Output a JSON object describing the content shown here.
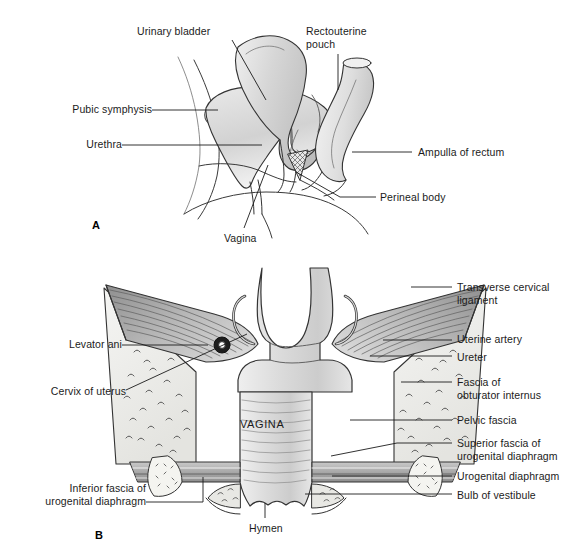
{
  "figure": {
    "background_color": "#ffffff",
    "ink_color": "#1b1b1b"
  },
  "panels": [
    {
      "letter": "A",
      "name": "sagittal-section",
      "letter_x": 92,
      "letter_y": 219,
      "labels": [
        {
          "id": "urinary-bladder",
          "text": "Urinary bladder",
          "align": "left",
          "x": 137,
          "y": 25,
          "leader": [
            [
              232,
              40
            ],
            [
              266,
              100
            ]
          ]
        },
        {
          "id": "rectouterine-pouch",
          "text": "Rectouterine\npouch",
          "align": "left",
          "x": 306,
          "y": 25,
          "leader": [
            [
              338,
              54
            ],
            [
              338,
              90
            ]
          ]
        },
        {
          "id": "pubic-symphysis",
          "text": "Pubic symphysis",
          "align": "right",
          "x": 45,
          "y": 103,
          "leader": [
            [
              152,
              110
            ],
            [
              218,
              110
            ]
          ]
        },
        {
          "id": "urethra",
          "text": "Urethra",
          "align": "right",
          "x": 83,
          "y": 138,
          "leader": [
            [
              122,
              145
            ],
            [
              262,
              145
            ]
          ]
        },
        {
          "id": "ampulla-of-rectum",
          "text": "Ampulla of rectum",
          "align": "left",
          "x": 420,
          "y": 146,
          "leader": [
            [
              352,
              152
            ],
            [
              412,
              152
            ]
          ]
        },
        {
          "id": "perineal-body",
          "text": "Perineal body",
          "align": "left",
          "x": 382,
          "y": 191,
          "leader": [
            [
              296,
              172
            ],
            [
              340,
              197
            ],
            [
              376,
              197
            ]
          ]
        },
        {
          "id": "vagina",
          "text": "Vagina",
          "align": "left",
          "x": 224,
          "y": 232,
          "leader": [
            [
              268,
              165
            ],
            [
              244,
              228
            ]
          ]
        }
      ]
    },
    {
      "letter": "B",
      "name": "coronal-section",
      "letter_x": 95,
      "letter_y": 529,
      "center_caption": "VAGINA",
      "center_caption_x": 240,
      "center_caption_y": 424,
      "labels": [
        {
          "id": "transverse-cervical-ligament",
          "text": "Transverse cervical\nligament",
          "align": "left",
          "x": 457,
          "y": 281,
          "leader": [
            [
              411,
              287
            ],
            [
              452,
              287
            ]
          ]
        },
        {
          "id": "uterine-artery",
          "text": "Uterine artery",
          "align": "left",
          "x": 457,
          "y": 333,
          "leader": [
            [
              383,
              340
            ],
            [
              452,
              340
            ]
          ]
        },
        {
          "id": "ureter",
          "text": "Ureter",
          "align": "left",
          "x": 457,
          "y": 351,
          "leader": [
            [
              370,
              356
            ],
            [
              452,
              356
            ]
          ]
        },
        {
          "id": "fascia-of-obturator-internus",
          "text": "Fascia of\nobturator internus",
          "align": "left",
          "x": 457,
          "y": 376,
          "leader": [
            [
              401,
              382
            ],
            [
              452,
              382
            ]
          ]
        },
        {
          "id": "pelvic-fascia",
          "text": "Pelvic fascia",
          "align": "left",
          "x": 457,
          "y": 414,
          "leader": [
            [
              350,
              420
            ],
            [
              452,
              420
            ]
          ]
        },
        {
          "id": "superior-fascia-ug-diaphragm",
          "text": "Superior fascia of\nurogenital diaphragm",
          "align": "left",
          "x": 457,
          "y": 437,
          "leader": [
            [
              331,
              456
            ],
            [
              397,
              443
            ],
            [
              452,
              443
            ]
          ]
        },
        {
          "id": "urogenital-diaphragm",
          "text": "Urogenital diaphragm",
          "align": "left",
          "x": 457,
          "y": 470,
          "leader": [
            [
              332,
              476
            ],
            [
              452,
              476
            ]
          ]
        },
        {
          "id": "bulb-of-vestibule",
          "text": "Bulb of vestibule",
          "align": "left",
          "x": 457,
          "y": 489,
          "leader": [
            [
              305,
              494
            ],
            [
              452,
              494
            ]
          ]
        },
        {
          "id": "levator-ani",
          "text": "Levator ani",
          "align": "right",
          "x": 48,
          "y": 338,
          "leader": [
            [
              122,
              345
            ],
            [
              208,
              345
            ]
          ]
        },
        {
          "id": "cervix-of-uterus",
          "text": "Cervix of uterus",
          "align": "right",
          "x": 28,
          "y": 385,
          "leader": [
            [
              126,
              390
            ],
            [
              247,
              334
            ]
          ]
        },
        {
          "id": "inferior-fascia-ug-diaphragm",
          "text": "Inferior fascia of\nurogenital diaphragm",
          "align": "right",
          "x": 22,
          "y": 482,
          "leader": [
            [
              146,
              502
            ],
            [
              203,
              502
            ],
            [
              203,
              477
            ]
          ]
        },
        {
          "id": "hymen",
          "text": "Hymen",
          "align": "left",
          "x": 249,
          "y": 522,
          "leader": [
            [
              265,
              503
            ],
            [
              265,
              518
            ]
          ]
        }
      ]
    }
  ]
}
